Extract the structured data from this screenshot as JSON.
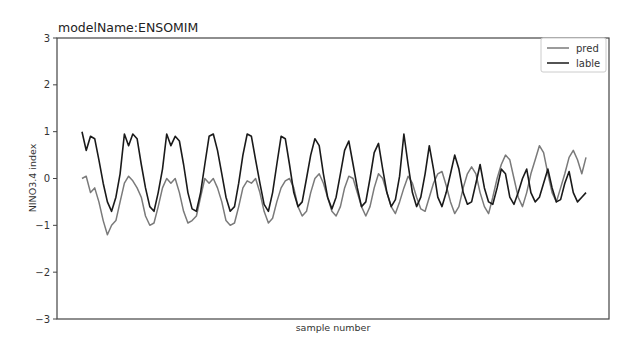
{
  "chart_data": {
    "type": "line",
    "title": "modelName:ENSOMIM",
    "xlabel": "sample number",
    "ylabel": "NINO3.4 index",
    "ylim": [
      -3,
      3
    ],
    "yticks": [
      3,
      2,
      1,
      0,
      -1,
      -2,
      -3
    ],
    "xticks": [],
    "legend_position": "upper right",
    "grid": false,
    "n_points": 120,
    "series": [
      {
        "name": "pred",
        "color": "#7a7a7a",
        "values": [
          0.0,
          0.05,
          -0.3,
          -0.2,
          -0.5,
          -0.9,
          -1.2,
          -1.0,
          -0.9,
          -0.5,
          -0.1,
          0.05,
          -0.05,
          -0.2,
          -0.4,
          -0.8,
          -1.0,
          -0.95,
          -0.6,
          -0.2,
          0.0,
          -0.1,
          0.0,
          -0.3,
          -0.7,
          -0.95,
          -0.9,
          -0.8,
          -0.4,
          0.0,
          -0.1,
          0.0,
          -0.2,
          -0.5,
          -0.9,
          -1.0,
          -0.95,
          -0.6,
          -0.2,
          -0.05,
          -0.1,
          0.0,
          -0.3,
          -0.7,
          -0.95,
          -0.85,
          -0.5,
          -0.2,
          -0.05,
          0.0,
          -0.2,
          -0.6,
          -0.8,
          -0.7,
          -0.3,
          0.0,
          0.1,
          -0.1,
          -0.4,
          -0.7,
          -0.8,
          -0.6,
          -0.2,
          0.05,
          0.0,
          -0.3,
          -0.6,
          -0.8,
          -0.6,
          -0.2,
          0.1,
          0.0,
          -0.3,
          -0.6,
          -0.75,
          -0.5,
          -0.2,
          0.05,
          -0.1,
          -0.4,
          -0.65,
          -0.7,
          -0.4,
          -0.1,
          0.1,
          0.15,
          -0.15,
          -0.5,
          -0.75,
          -0.6,
          -0.2,
          0.1,
          0.25,
          0.1,
          -0.3,
          -0.6,
          -0.75,
          -0.4,
          0.0,
          0.3,
          0.5,
          0.4,
          0.0,
          -0.4,
          -0.6,
          -0.3,
          0.1,
          0.4,
          0.7,
          0.55,
          0.1,
          -0.3,
          -0.5,
          -0.2,
          0.1,
          0.45,
          0.6,
          0.4,
          0.1,
          0.45
        ]
      },
      {
        "name": "lable",
        "color": "#1a1a1a",
        "values": [
          1.0,
          0.6,
          0.9,
          0.85,
          0.4,
          -0.1,
          -0.5,
          -0.7,
          -0.4,
          0.1,
          0.95,
          0.7,
          0.95,
          0.85,
          0.3,
          -0.2,
          -0.6,
          -0.7,
          -0.3,
          0.2,
          0.95,
          0.7,
          0.9,
          0.8,
          0.3,
          -0.3,
          -0.65,
          -0.7,
          -0.3,
          0.3,
          0.9,
          0.95,
          0.6,
          0.1,
          -0.4,
          -0.7,
          -0.6,
          -0.1,
          0.5,
          0.95,
          0.9,
          0.4,
          -0.1,
          -0.55,
          -0.7,
          -0.3,
          0.3,
          0.9,
          0.85,
          0.3,
          -0.3,
          -0.6,
          -0.5,
          0.0,
          0.5,
          0.85,
          0.7,
          0.1,
          -0.4,
          -0.65,
          -0.4,
          0.1,
          0.6,
          0.8,
          0.3,
          -0.2,
          -0.6,
          -0.5,
          0.0,
          0.55,
          0.75,
          0.2,
          -0.3,
          -0.6,
          -0.45,
          0.05,
          0.95,
          0.3,
          -0.3,
          -0.6,
          -0.4,
          0.1,
          0.7,
          0.2,
          -0.4,
          -0.6,
          -0.3,
          0.1,
          0.5,
          0.2,
          -0.3,
          -0.55,
          -0.5,
          -0.1,
          0.3,
          -0.2,
          -0.5,
          -0.55,
          -0.2,
          0.2,
          0.1,
          -0.4,
          -0.55,
          -0.3,
          0.0,
          0.2,
          -0.3,
          -0.5,
          -0.4,
          -0.1,
          0.2,
          -0.2,
          -0.5,
          -0.45,
          -0.1,
          0.15,
          -0.3,
          -0.5,
          -0.4,
          -0.3
        ]
      }
    ]
  }
}
